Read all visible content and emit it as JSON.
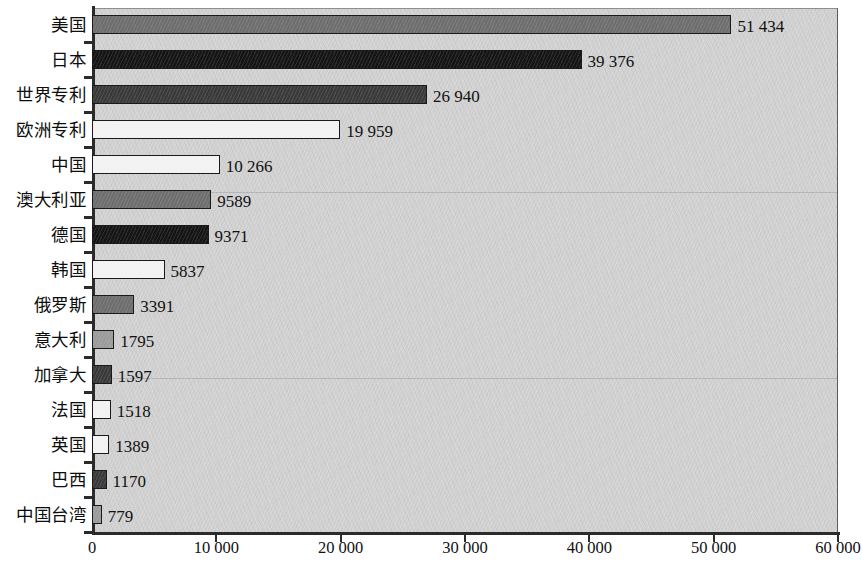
{
  "chart_data": {
    "type": "bar",
    "orientation": "horizontal",
    "title": "",
    "xlabel": "",
    "ylabel": "",
    "xlim": [
      0,
      60000
    ],
    "grid": false,
    "legend": "none",
    "xticks": [
      0,
      10000,
      20000,
      30000,
      40000,
      50000,
      60000
    ],
    "xtick_labels": [
      "0",
      "10 000",
      "20 000",
      "30 000",
      "40 000",
      "50 000",
      "60 000"
    ],
    "categories": [
      "美国",
      "日本",
      "世界专利",
      "欧洲专利",
      "中国",
      "澳大利亚",
      "德国",
      "韩国",
      "俄罗斯",
      "意大利",
      "加拿大",
      "法国",
      "英国",
      "巴西",
      "中国台湾"
    ],
    "values": [
      51434,
      39376,
      26940,
      19959,
      10266,
      9589,
      9371,
      5837,
      3391,
      1795,
      1597,
      1518,
      1389,
      1170,
      779
    ],
    "value_labels": [
      "51 434",
      "39 376",
      "26 940",
      "19 959",
      "10 266",
      "9589",
      "9371",
      "5837",
      "3391",
      "1795",
      "1597",
      "1518",
      "1389",
      "1170",
      "779"
    ],
    "bar_fills": [
      "dark",
      "black",
      "darker",
      "white",
      "white",
      "dark",
      "black",
      "white",
      "dark",
      "mid",
      "darker",
      "white",
      "white",
      "darker",
      "mid"
    ]
  },
  "colors": {
    "plot_background": "#d0d0d0",
    "axis": "#2b2b2b",
    "bar_outline": "#1a1a1a",
    "fill_dark": "#6e6e6e",
    "fill_black": "#151515",
    "fill_darker": "#3a3a3a",
    "fill_white": "#f2f2f2",
    "fill_mid": "#9b9b9b",
    "text": "#111111"
  }
}
